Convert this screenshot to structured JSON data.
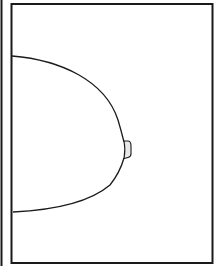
{
  "diagram": {
    "elements": [
      {
        "name": "frame",
        "description": "rectangular border"
      },
      {
        "name": "left-edge-line",
        "description": "partial vertical line at far left"
      },
      {
        "name": "breast-contour",
        "description": "curved outline of breast"
      },
      {
        "name": "nipple",
        "description": "nipple projection at apex"
      }
    ],
    "colors": {
      "line": "#1a1a1a",
      "background": "#ffffff",
      "nipple_fill": "#e8e8e8"
    }
  }
}
